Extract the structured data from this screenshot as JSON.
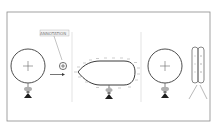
{
  "diagram": {
    "type": "electrostatics-charging-illustration",
    "panels": [
      {
        "id": "panel-1",
        "description": "Charged conducting sphere on insulating stand with positive charge marker",
        "sphere_sign": "+"
      },
      {
        "id": "panel-2",
        "description": "Teardrop-shaped conductor with negative charges distributed on surface",
        "surface_charge": "-"
      },
      {
        "id": "panel-3",
        "description": "Charged sphere on stand next to electroscope with diverging leaves",
        "sphere_sign": "+"
      }
    ],
    "callout_label": "ANNOTATION",
    "test_charge_sign": "+",
    "arrow": "right"
  },
  "colors": {
    "line": "#3a3a3a",
    "frame": "#888888",
    "divider": "#cccccc",
    "stand_base": "#222222",
    "stand_neck": "#999999"
  }
}
